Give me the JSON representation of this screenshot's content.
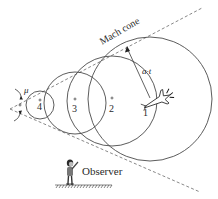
{
  "diagram": {
    "title": "Mach cone",
    "cone_label": "Mach cone",
    "angle_label": "μ",
    "radius_label": "a·t",
    "observer_label": "Observer",
    "wavefronts": [
      {
        "id": "1",
        "label": "1"
      },
      {
        "id": "2",
        "label": "2"
      },
      {
        "id": "3",
        "label": "3"
      },
      {
        "id": "4",
        "label": "4"
      }
    ],
    "center_marker": "+",
    "colors": {
      "line": "#4a4a4a",
      "dashed": "#6a6a6a",
      "text": "#2a2a2a",
      "background": "#ffffff"
    }
  }
}
